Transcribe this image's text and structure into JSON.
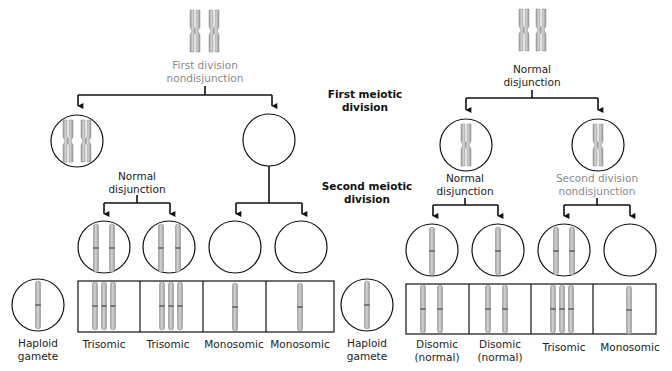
{
  "stage_labels": {
    "first": {
      "line1": "First meiotic",
      "line2": "division"
    },
    "second": {
      "line1": "Second meiotic",
      "line2": "division"
    }
  },
  "left_panel": {
    "top_label": {
      "line1": "First division",
      "line2": "nondisjunction"
    },
    "mid_label": {
      "line1": "Normal",
      "line2": "disjunction"
    },
    "haploid_label": {
      "line1": "Haploid",
      "line2": "gamete"
    },
    "zygotes": [
      {
        "line1": "Trisomic",
        "line2": ""
      },
      {
        "line1": "Trisomic",
        "line2": ""
      },
      {
        "line1": "Monosomic",
        "line2": ""
      },
      {
        "line1": "Monosomic",
        "line2": ""
      }
    ]
  },
  "right_panel": {
    "top_label": {
      "line1": "Normal",
      "line2": "disjunction"
    },
    "mid_left_label": {
      "line1": "Normal",
      "line2": "disjunction"
    },
    "mid_right_label": {
      "line1": "Second division",
      "line2": "nondisjunction"
    },
    "haploid_label": {
      "line1": "Haploid",
      "line2": "gamete"
    },
    "zygotes": [
      {
        "line1": "Disomic",
        "line2": "(normal)"
      },
      {
        "line1": "Disomic",
        "line2": "(normal)"
      },
      {
        "line1": "Trisomic",
        "line2": ""
      },
      {
        "line1": "Monosomic",
        "line2": ""
      }
    ]
  },
  "colors": {
    "line": "#111111",
    "chromosome": "#b9b9b9",
    "chromosome_edge": "#8c8c8c",
    "highlight_label": "#8a8a8a"
  }
}
